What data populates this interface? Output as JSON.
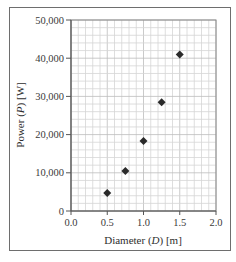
{
  "chart_data": {
    "type": "scatter",
    "title": "",
    "xlabel": "Diameter (D) [m]",
    "ylabel": "Power (P) [W]",
    "xlim": [
      0.0,
      2.0
    ],
    "ylim": [
      0,
      50000
    ],
    "x_ticks": [
      "0.0",
      "0.5",
      "1.0",
      "1.5",
      "2.0"
    ],
    "y_ticks": [
      "0",
      "10,000",
      "20,000",
      "30,000",
      "40,000",
      "50,000"
    ],
    "grid": true,
    "grid_minor_x_step": 0.1,
    "grid_minor_y_step": 2000,
    "marker": "diamond",
    "marker_color": "#2a2a2a",
    "series": [
      {
        "name": "Power vs Diameter",
        "x": [
          0.5,
          0.75,
          1.0,
          1.25,
          1.5
        ],
        "y": [
          4700,
          10500,
          18300,
          28500,
          41000
        ]
      }
    ],
    "legend": null
  },
  "labels": {
    "x_axis_prefix": "Diameter (",
    "x_axis_var": "D",
    "x_axis_suffix": ") [m]",
    "y_axis_prefix": "Power (",
    "y_axis_var": "P",
    "y_axis_suffix": ") [W]"
  }
}
